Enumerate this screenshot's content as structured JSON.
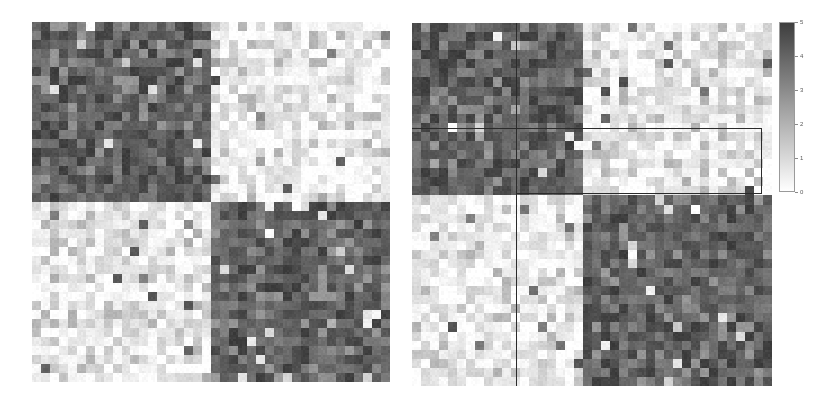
{
  "figure": {
    "background": "#ffffff",
    "width": 831,
    "height": 405,
    "type": "two-panel-grayscale-heatmap"
  },
  "colorbar": {
    "name": "colorbar",
    "orientation": "vertical",
    "vmin": 0,
    "vmax": 5,
    "colormap": "grayscale-reversed",
    "low_color": "#ffffff",
    "high_color": "#4a4a4a",
    "ticks": [
      "0",
      "1",
      "2",
      "3",
      "4",
      "5"
    ],
    "tick_values": [
      0,
      1,
      2,
      3,
      4,
      5
    ],
    "geometry": {
      "x": 779,
      "y": 22,
      "width": 16,
      "height": 170
    }
  },
  "panels": [
    {
      "id": "left-panel",
      "name": "adjacency-heatmap-unpartitioned",
      "geometry": {
        "x": 32,
        "y": 22,
        "width": 358,
        "height": 360
      },
      "grid": {
        "rows": 40,
        "cols": 40
      },
      "blocks": [
        {
          "row_start": 0,
          "row_end": 20,
          "col_start": 0,
          "col_end": 20,
          "mean": 4.1,
          "shade": "dark"
        },
        {
          "row_start": 0,
          "row_end": 20,
          "col_start": 20,
          "col_end": 40,
          "mean": 0.55,
          "shade": "light"
        },
        {
          "row_start": 20,
          "row_end": 40,
          "col_start": 0,
          "col_end": 20,
          "mean": 0.55,
          "shade": "light"
        },
        {
          "row_start": 20,
          "row_end": 40,
          "col_start": 20,
          "col_end": 40,
          "mean": 4.1,
          "shade": "dark"
        }
      ],
      "split_fraction_x": 0.49,
      "split_fraction_y": 0.495,
      "overlays": []
    },
    {
      "id": "right-panel",
      "name": "adjacency-heatmap-partitioned",
      "geometry": {
        "x": 412,
        "y": 23,
        "width": 360,
        "height": 363
      },
      "grid": {
        "rows": 40,
        "cols": 40
      },
      "blocks": [
        {
          "row_start": 0,
          "row_end": 19,
          "col_start": 0,
          "col_end": 19,
          "mean": 4.1,
          "shade": "dark"
        },
        {
          "row_start": 0,
          "row_end": 19,
          "col_start": 19,
          "col_end": 40,
          "mean": 0.55,
          "shade": "light"
        },
        {
          "row_start": 19,
          "row_end": 40,
          "col_start": 0,
          "col_end": 19,
          "mean": 0.55,
          "shade": "light"
        },
        {
          "row_start": 19,
          "row_end": 40,
          "col_start": 19,
          "col_end": 40,
          "mean": 4.1,
          "shade": "dark"
        }
      ],
      "split_fraction_x": 0.475,
      "split_fraction_y": 0.47,
      "overlays": [
        {
          "kind": "vline",
          "name": "partition-divider-vertical",
          "x_frac": 0.288,
          "y0_frac": 0.0,
          "y1_frac": 1.0
        },
        {
          "kind": "hline",
          "name": "partition-divider-horizontal",
          "y_frac": 0.288,
          "x0_frac": 0.0,
          "x1_frac": 0.475
        },
        {
          "kind": "rect",
          "name": "highlighted-submatrix-box",
          "x_frac": 0.288,
          "y_frac": 0.288,
          "w_frac": 0.685,
          "h_frac": 0.183
        }
      ]
    }
  ],
  "chart_data": {
    "type": "heatmap",
    "title": "",
    "subtitle": "",
    "xlabel": "",
    "ylabel": "",
    "colormap": "grays_reversed",
    "colorbar_label": "",
    "vmin": 0,
    "vmax": 5,
    "legend_position": "right",
    "grid": false,
    "tick_labels": {
      "x": [],
      "y": []
    },
    "panel_count": 2,
    "matrix_shape": [
      40,
      40
    ],
    "series": [
      {
        "name": "left-panel",
        "blocks": [
          {
            "block": "top-left",
            "rows": [
              0,
              20
            ],
            "cols": [
              0,
              20
            ],
            "mean_value": 4.1,
            "sd": 0.7
          },
          {
            "block": "top-right",
            "rows": [
              0,
              20
            ],
            "cols": [
              20,
              40
            ],
            "mean_value": 0.55,
            "sd": 0.7
          },
          {
            "block": "bottom-left",
            "rows": [
              20,
              40
            ],
            "cols": [
              0,
              20
            ],
            "mean_value": 0.55,
            "sd": 0.7
          },
          {
            "block": "bottom-right",
            "rows": [
              20,
              40
            ],
            "cols": [
              20,
              40
            ],
            "mean_value": 4.1,
            "sd": 0.7
          }
        ]
      },
      {
        "name": "right-panel",
        "blocks": [
          {
            "block": "top-left",
            "rows": [
              0,
              19
            ],
            "cols": [
              0,
              19
            ],
            "mean_value": 4.1,
            "sd": 0.7
          },
          {
            "block": "top-right",
            "rows": [
              0,
              19
            ],
            "cols": [
              19,
              40
            ],
            "mean_value": 0.55,
            "sd": 0.7
          },
          {
            "block": "bottom-left",
            "rows": [
              19,
              40
            ],
            "cols": [
              0,
              19
            ],
            "mean_value": 0.55,
            "sd": 0.7
          },
          {
            "block": "bottom-right",
            "rows": [
              19,
              40
            ],
            "cols": [
              19,
              40
            ],
            "mean_value": 4.1,
            "sd": 0.7
          }
        ]
      }
    ],
    "colorbar_ticks": [
      0,
      1,
      2,
      3,
      4,
      5
    ]
  }
}
